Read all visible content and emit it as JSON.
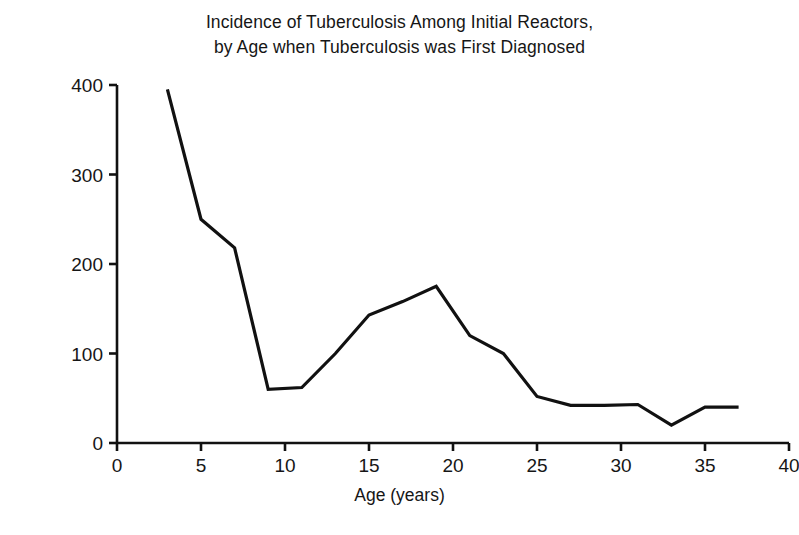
{
  "chart_data": {
    "type": "line",
    "title": "Incidence of Tuberculosis Among Initial Reactors, by Age when Tuberculosis was First Diagnosed",
    "title_lines": [
      "Incidence of Tuberculosis Among Initial Reactors,",
      "by Age when Tuberculosis was First Diagnosed"
    ],
    "xlabel": "Age (years)",
    "ylabel": "Average annual case rate (per 100,000)",
    "xlim": [
      0,
      40
    ],
    "ylim": [
      0,
      400
    ],
    "xticks": [
      0,
      5,
      10,
      15,
      20,
      25,
      30,
      35,
      40
    ],
    "yticks": [
      0,
      100,
      200,
      300,
      400
    ],
    "xtick_labels": [
      "0",
      "5",
      "10",
      "15",
      "20",
      "25",
      "30",
      "35",
      "40"
    ],
    "ytick_labels": [
      "0",
      "100",
      "200",
      "300",
      "400"
    ],
    "grid": false,
    "legend": false,
    "line_color": "#111111",
    "line_width": 3.2,
    "series": [
      {
        "name": "Average annual case rate",
        "x": [
          3,
          5,
          7,
          9,
          11,
          13,
          15,
          17,
          19,
          21,
          23,
          25,
          27,
          29,
          31,
          33,
          35,
          37
        ],
        "values": [
          395,
          250,
          218,
          60,
          62,
          100,
          143,
          158,
          175,
          120,
          100,
          52,
          42,
          42,
          43,
          20,
          40,
          40
        ]
      }
    ]
  }
}
